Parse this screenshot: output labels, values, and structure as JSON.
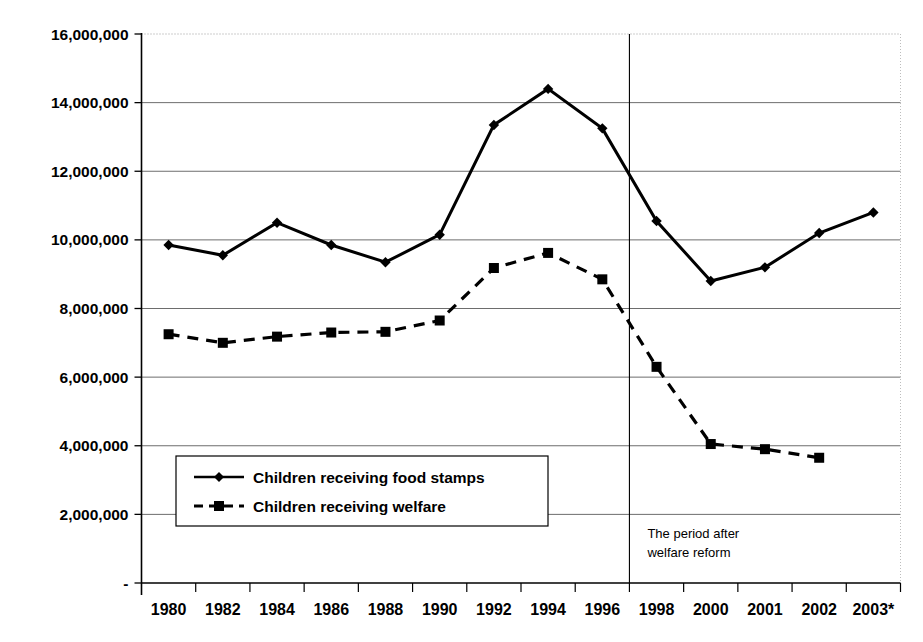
{
  "chart_data": {
    "type": "line",
    "title": "",
    "subtitle": "",
    "xlabel": "",
    "ylabel": "",
    "categories": [
      "1980",
      "1982",
      "1984",
      "1986",
      "1988",
      "1990",
      "1992",
      "1994",
      "1996",
      "1998",
      "2000",
      "2001",
      "2002",
      "2003*"
    ],
    "ylim": [
      0,
      16000000
    ],
    "ytick_values": [
      0,
      2000000,
      4000000,
      6000000,
      8000000,
      10000000,
      12000000,
      14000000,
      16000000
    ],
    "ytick_labels": [
      "-",
      "2,000,000",
      "4,000,000",
      "6,000,000",
      "8,000,000",
      "10,000,000",
      "12,000,000",
      "14,000,000",
      "16,000,000"
    ],
    "grid": true,
    "legend_position": "inside-lower-left",
    "series": [
      {
        "name": "Children receiving food stamps",
        "marker": "diamond",
        "linestyle": "solid",
        "color": "#000000",
        "values": [
          9850000,
          9550000,
          10500000,
          9850000,
          9350000,
          10150000,
          13350000,
          14400000,
          13250000,
          10550000,
          8800000,
          9200000,
          10200000,
          10800000
        ]
      },
      {
        "name": "Children receiving welfare",
        "marker": "square",
        "linestyle": "dashed",
        "color": "#000000",
        "values": [
          7250000,
          7000000,
          7180000,
          7300000,
          7320000,
          7650000,
          9180000,
          9620000,
          8850000,
          6300000,
          4050000,
          3900000,
          3650000,
          null
        ]
      }
    ],
    "annotations": [
      {
        "name": "welfare-reform-divider",
        "type": "vertical-line",
        "at_category": "1996",
        "text_lines": [
          "The period after",
          "welfare reform"
        ]
      }
    ]
  },
  "legend": {
    "items": [
      {
        "label": "Children receiving food stamps",
        "marker": "diamond",
        "linestyle": "solid"
      },
      {
        "label": "Children receiving welfare",
        "marker": "square",
        "linestyle": "dashed"
      }
    ]
  }
}
